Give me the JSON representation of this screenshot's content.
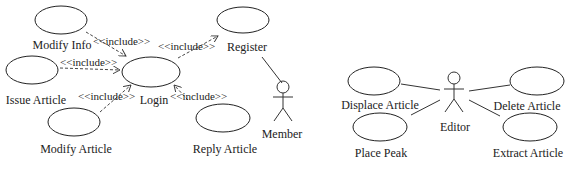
{
  "diagrams": [
    {
      "actor": {
        "name": "Member"
      },
      "use_cases": [
        {
          "label": "Modify Info"
        },
        {
          "label": "Issue Article"
        },
        {
          "label": "Modify Article"
        },
        {
          "label": "Login"
        },
        {
          "label": "Register"
        },
        {
          "label": "Reply Article"
        }
      ],
      "relations": [
        {
          "from": "Modify Info",
          "to": "Login",
          "stereotype": "<<include>>"
        },
        {
          "from": "Issue Article",
          "to": "Login",
          "stereotype": "<<include>>"
        },
        {
          "from": "Modify Article",
          "to": "Login",
          "stereotype": "<<include>>"
        },
        {
          "from": "Reply Article",
          "to": "Login",
          "stereotype": "<<include>>"
        },
        {
          "from": "Login",
          "to": "Register",
          "stereotype": "<<include>>"
        }
      ]
    },
    {
      "actor": {
        "name": "Editor"
      },
      "use_cases": [
        {
          "label": "Displace Article"
        },
        {
          "label": "Place Peak"
        },
        {
          "label": "Delete Article"
        },
        {
          "label": "Extract Article"
        }
      ]
    }
  ]
}
